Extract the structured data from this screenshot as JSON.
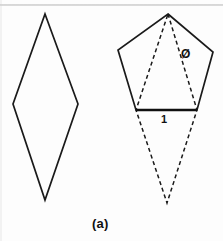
{
  "figure": {
    "caption": "(a)",
    "background_color": "#fdfdfd",
    "stroke_color": "#1a1a1a",
    "labels": {
      "angle_symbol": "Ø",
      "side_length": "1"
    },
    "shapes": {
      "rhombus": {
        "name": "rhombus",
        "style": "solid",
        "points": "45,14 78,104 45,200 13,104",
        "vertices": [
          {
            "name": "top",
            "x": 45,
            "y": 14
          },
          {
            "name": "right",
            "x": 78,
            "y": 104
          },
          {
            "name": "bottom",
            "x": 45,
            "y": 200
          },
          {
            "name": "left",
            "x": 13,
            "y": 104
          }
        ]
      },
      "pentagon": {
        "name": "pentagon",
        "style": "solid",
        "points": "168,14 213,52 197,110 136,110 118,50",
        "vertices": [
          {
            "name": "apex",
            "x": 168,
            "y": 14
          },
          {
            "name": "upper-right",
            "x": 213,
            "y": 52
          },
          {
            "name": "lower-right",
            "x": 197,
            "y": 110
          },
          {
            "name": "lower-left",
            "x": 136,
            "y": 110
          },
          {
            "name": "upper-left",
            "x": 118,
            "y": 50
          }
        ]
      },
      "base_segment": {
        "name": "base-segment",
        "style": "solid-thick",
        "x1": 136,
        "y1": 110,
        "x2": 197,
        "y2": 110
      },
      "inscribed_rhombus": {
        "name": "inscribed-rhombus",
        "style": "dashed",
        "points": "168,14 197,110 167,203 136,110",
        "vertices": [
          {
            "name": "top",
            "x": 168,
            "y": 14
          },
          {
            "name": "right",
            "x": 197,
            "y": 110
          },
          {
            "name": "bottom",
            "x": 167,
            "y": 203
          },
          {
            "name": "left",
            "x": 136,
            "y": 110
          }
        ]
      }
    }
  }
}
